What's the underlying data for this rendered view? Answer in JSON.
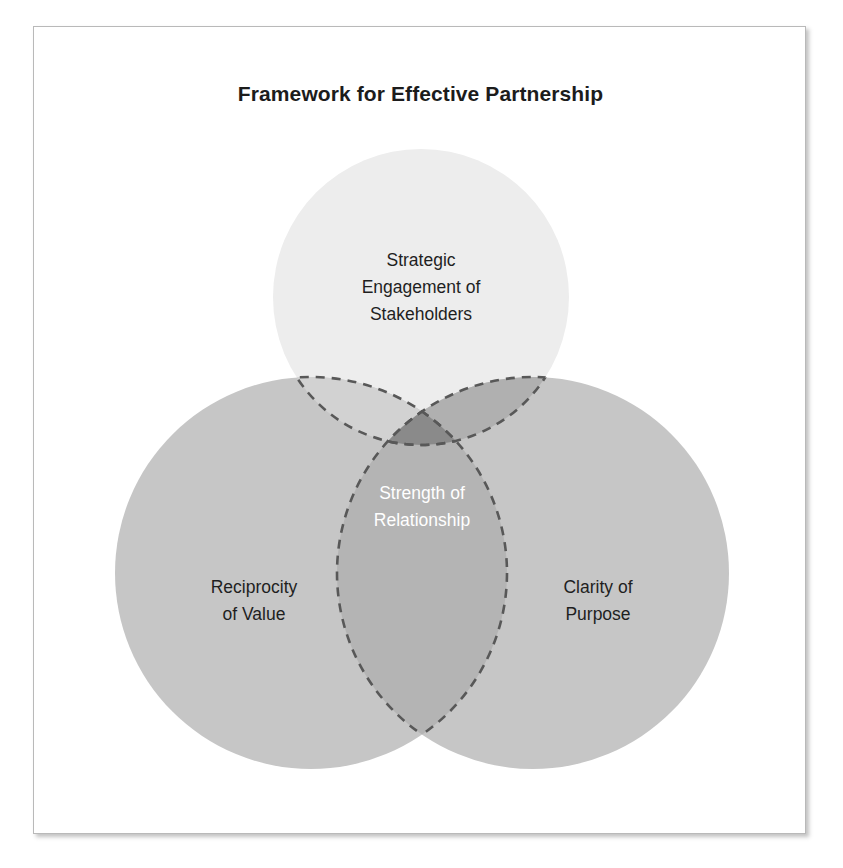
{
  "figure": {
    "title": "Framework for Effective Partnership",
    "type": "venn-diagram-3-set"
  },
  "chart_data": {
    "type": "venn",
    "title": "Framework for Effective Partnership",
    "sets": [
      {
        "id": "top",
        "label": "Strategic Engagement of Stakeholders",
        "label_lines": [
          "Strategic",
          "Engagement of",
          "Stakeholders"
        ],
        "fill": "#ededed",
        "text_color": "#1f1f1f",
        "border": "dashed",
        "cx": 420,
        "cy": 296,
        "r": 148
      },
      {
        "id": "left",
        "label": "Reciprocity of Value",
        "label_lines": [
          "Reciprocity",
          "of Value"
        ],
        "fill": "#c6c6c6",
        "text_color": "#1f1f1f",
        "border": "dashed",
        "cx": 310,
        "cy": 572,
        "r": 196
      },
      {
        "id": "right",
        "label": "Clarity of Purpose",
        "label_lines": [
          "Clarity of",
          "Purpose"
        ],
        "fill": "#c6c6c6",
        "text_color": "#1f1f1f",
        "border": "dashed",
        "cx": 532,
        "cy": 572,
        "r": 196
      }
    ],
    "intersections": [
      {
        "id": "top-left",
        "sets": [
          "top",
          "left"
        ],
        "fill": "#d2d2d2",
        "label": ""
      },
      {
        "id": "top-right",
        "sets": [
          "top",
          "right"
        ],
        "fill": "#b0b0b0",
        "label": ""
      },
      {
        "id": "left-right",
        "sets": [
          "left",
          "right"
        ],
        "fill": "#b4b4b4",
        "label": ""
      },
      {
        "id": "center",
        "sets": [
          "top",
          "left",
          "right"
        ],
        "fill": "#8a8a8a",
        "label": "Strength of Relationship",
        "label_lines": [
          "Strength of",
          "Relationship"
        ],
        "text_color": "#ffffff"
      }
    ],
    "dash_color": "#585858",
    "panel_background": "#ffffff",
    "panel_border": "#b9b9b9"
  }
}
